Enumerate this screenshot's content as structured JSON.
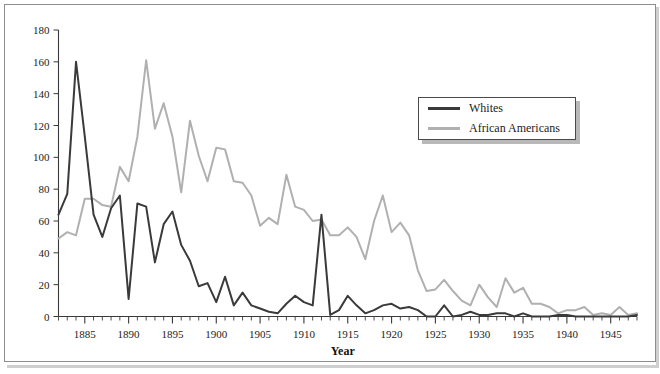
{
  "chart_data": {
    "type": "line",
    "title": "",
    "subtitle": "",
    "xlabel": "Year",
    "ylabel": "",
    "xlim": [
      1882,
      1948
    ],
    "ylim": [
      0,
      180
    ],
    "grid": false,
    "legend_position": "upper-right",
    "y_ticks": [
      0,
      20,
      40,
      60,
      80,
      100,
      120,
      140,
      160,
      180
    ],
    "y_tick_labels": [
      "0",
      "20",
      "40",
      "60",
      "80",
      "100",
      "120",
      "140",
      "160",
      "180"
    ],
    "x_ticks": [
      1885,
      1890,
      1895,
      1900,
      1905,
      1910,
      1915,
      1920,
      1925,
      1930,
      1935,
      1940,
      1945
    ],
    "x_tick_labels": [
      "1885",
      "1890",
      "1895",
      "1900",
      "1905",
      "1910",
      "1915",
      "1920",
      "1925",
      "1930",
      "1935",
      "1940",
      "1945"
    ],
    "x_minor_tick_interval": 1,
    "x": [
      1882,
      1883,
      1884,
      1885,
      1886,
      1887,
      1888,
      1889,
      1890,
      1891,
      1892,
      1893,
      1894,
      1895,
      1896,
      1897,
      1898,
      1899,
      1900,
      1901,
      1902,
      1903,
      1904,
      1905,
      1906,
      1907,
      1908,
      1909,
      1910,
      1911,
      1912,
      1913,
      1914,
      1915,
      1916,
      1917,
      1918,
      1919,
      1920,
      1921,
      1922,
      1923,
      1924,
      1925,
      1926,
      1927,
      1928,
      1929,
      1930,
      1931,
      1932,
      1933,
      1934,
      1935,
      1936,
      1937,
      1938,
      1939,
      1940,
      1941,
      1942,
      1943,
      1944,
      1945,
      1946,
      1947,
      1948
    ],
    "series": [
      {
        "name": "Whites",
        "color": "#3a3a3a",
        "values": [
          64,
          77,
          160,
          113,
          64,
          50,
          68,
          76,
          11,
          71,
          69,
          34,
          58,
          66,
          45,
          35,
          19,
          21,
          9,
          25,
          7,
          15,
          7,
          5,
          3,
          2,
          8,
          13,
          9,
          7,
          64,
          1,
          4,
          13,
          7,
          2,
          4,
          7,
          8,
          5,
          6,
          4,
          0,
          0,
          7,
          0,
          1,
          3,
          1,
          1,
          2,
          2,
          0,
          2,
          0,
          0,
          0,
          1,
          1,
          0,
          0,
          0,
          0,
          0,
          0,
          0,
          1
        ]
      },
      {
        "name": "African Americans",
        "color": "#b0b0b0",
        "values": [
          49,
          53,
          51,
          74,
          74,
          70,
          69,
          94,
          85,
          113,
          161,
          118,
          134,
          113,
          78,
          123,
          101,
          85,
          106,
          105,
          85,
          84,
          76,
          57,
          62,
          58,
          89,
          69,
          67,
          60,
          61,
          51,
          51,
          56,
          50,
          36,
          60,
          76,
          53,
          59,
          51,
          29,
          16,
          17,
          23,
          16,
          10,
          7,
          20,
          12,
          6,
          24,
          15,
          18,
          8,
          8,
          6,
          2,
          4,
          4,
          6,
          1,
          2,
          1,
          6,
          1,
          2
        ]
      }
    ]
  },
  "legend": {
    "items": [
      {
        "label": "Whites",
        "color": "#3a3a3a"
      },
      {
        "label": "African Americans",
        "color": "#b0b0b0"
      }
    ]
  },
  "axis": {
    "x_title": "Year"
  }
}
